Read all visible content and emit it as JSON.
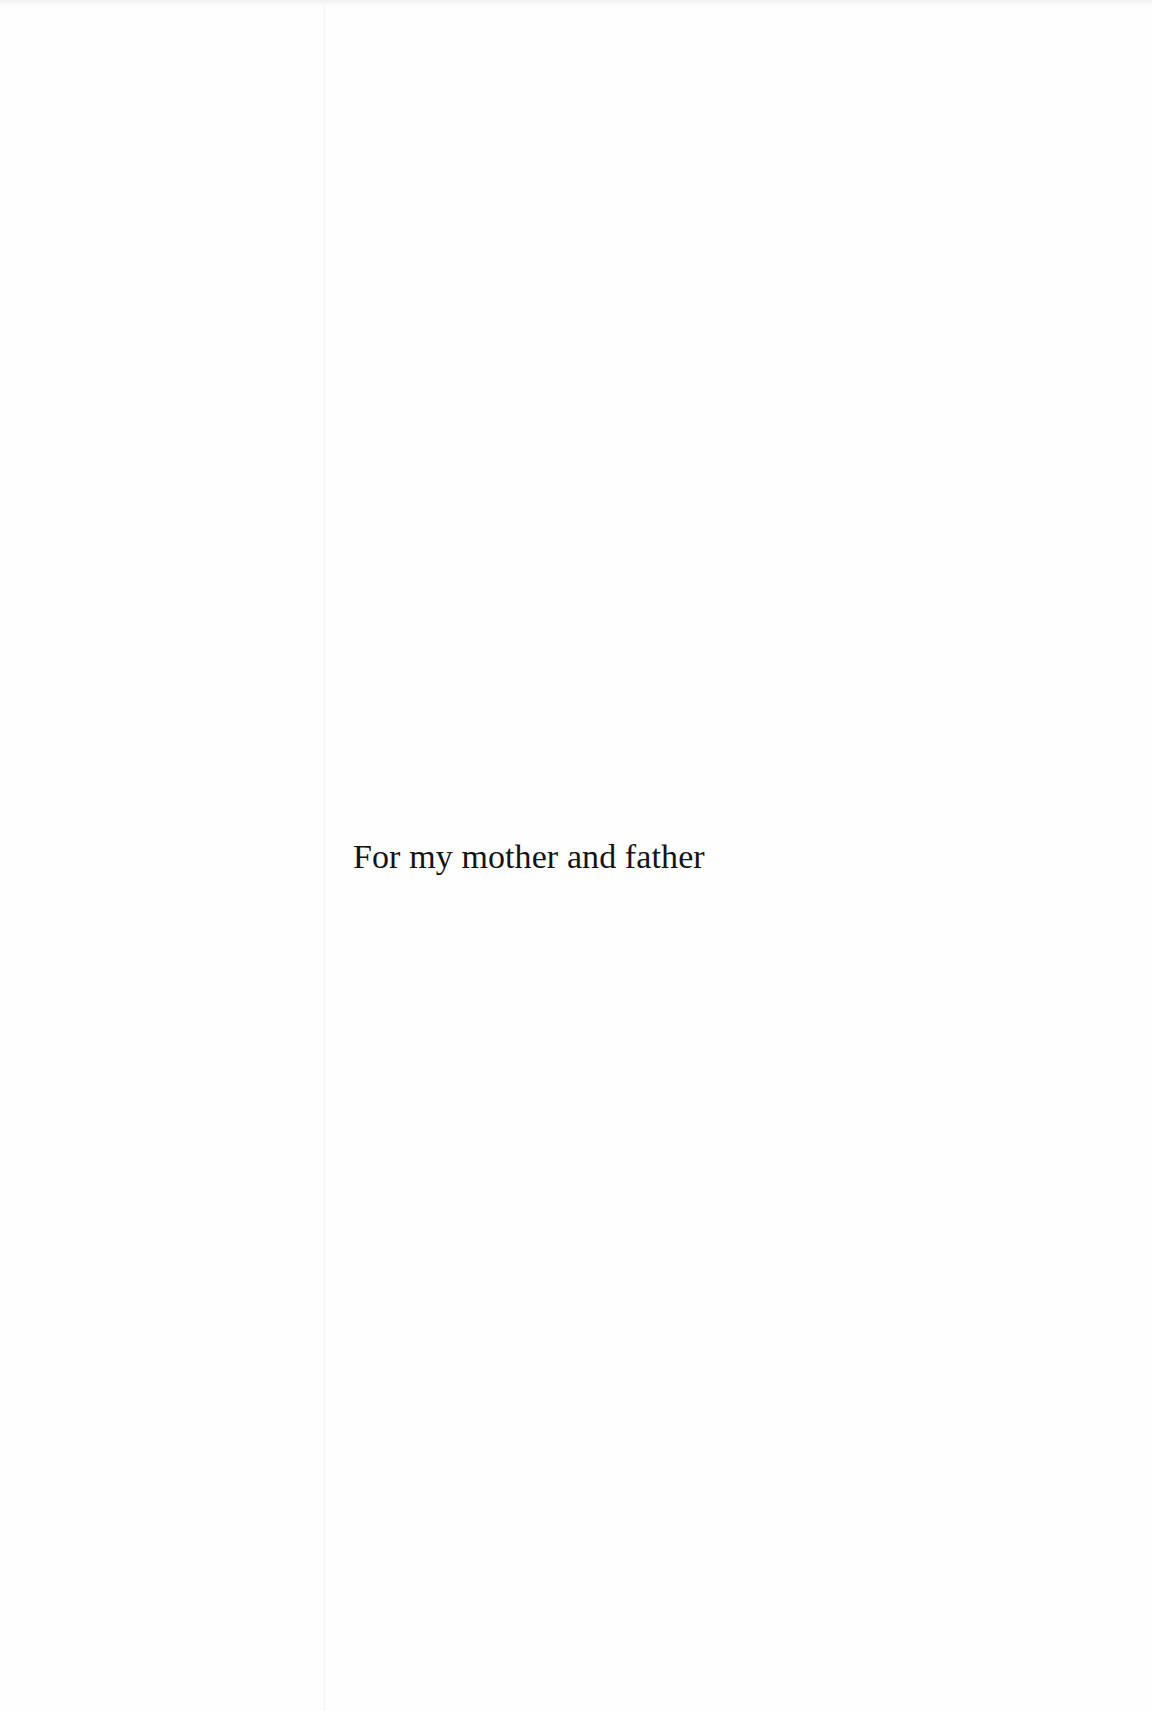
{
  "page": {
    "dedication": "For my mother and father"
  },
  "colors": {
    "background": "#fefefe",
    "text": "#141414"
  }
}
